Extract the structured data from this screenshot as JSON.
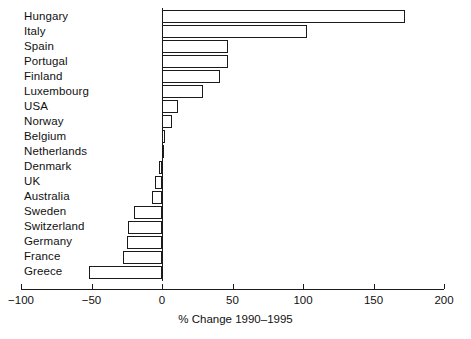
{
  "chart_data": {
    "type": "bar",
    "orientation": "horizontal",
    "title": "",
    "xlabel": "% Change 1990–1995",
    "ylabel": "",
    "xlim": [
      -100,
      200
    ],
    "xticks": [
      -100,
      -50,
      0,
      50,
      100,
      150,
      200
    ],
    "xtick_labels": [
      "−100",
      "−50",
      "0",
      "50",
      "100",
      "150",
      "200"
    ],
    "grid": false,
    "legend": null,
    "categories": [
      "Hungary",
      "Italy",
      "Spain",
      "Portugal",
      "Finland",
      "Luxembourg",
      "USA",
      "Norway",
      "Belgium",
      "Netherlands",
      "Denmark",
      "UK",
      "Australia",
      "Sweden",
      "Switzerland",
      "Germany",
      "France",
      "Greece"
    ],
    "values": [
      172,
      103,
      47,
      47,
      41,
      29,
      11,
      7,
      2,
      0,
      -2,
      -5,
      -7,
      -20,
      -24,
      -25,
      -28,
      -52
    ],
    "bar_facecolor": "#ffffff",
    "bar_edgecolor": "#1a1a1a"
  }
}
